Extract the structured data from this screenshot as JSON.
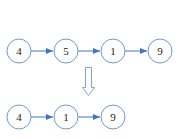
{
  "diagram": {
    "colors": {
      "node_stroke": "#6a9ad6",
      "edge": "#3f74c8",
      "transform_arrow": "#7fa5d8",
      "text": "#222222",
      "background": "#ffffff"
    },
    "before": {
      "nodes": [
        {
          "label": "4",
          "cx": 19,
          "cy": 51
        },
        {
          "label": "5",
          "cx": 66,
          "cy": 51
        },
        {
          "label": "1",
          "cx": 113,
          "cy": 51
        },
        {
          "label": "9",
          "cx": 160,
          "cy": 51
        }
      ]
    },
    "transform_arrow": {
      "direction": "down",
      "meaning": "delete node 5"
    },
    "after": {
      "nodes": [
        {
          "label": "4",
          "cx": 19,
          "cy": 117
        },
        {
          "label": "1",
          "cx": 66,
          "cy": 117
        },
        {
          "label": "9",
          "cx": 113,
          "cy": 117
        }
      ]
    }
  }
}
